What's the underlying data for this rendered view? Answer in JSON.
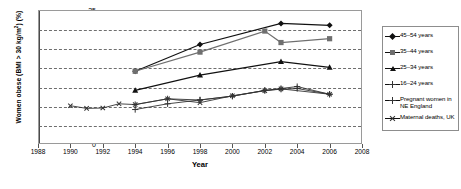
{
  "chart_data": {
    "type": "line",
    "title": "",
    "xlabel": "Year",
    "ylabel": "Women obese (BMI > 30 kg/m²) (%)",
    "ylabel_main": "Women obese (BMI > 30 kg/m",
    "ylabel_sup": "2",
    "ylabel_tail": ") (%)",
    "xlim": [
      1988,
      2008
    ],
    "ylim": [
      0,
      35
    ],
    "xticks": [
      1988,
      1990,
      1992,
      1994,
      1996,
      1998,
      2000,
      2002,
      2004,
      2006,
      2008
    ],
    "yticks": [
      0,
      5,
      10,
      15,
      20,
      25,
      30,
      35
    ],
    "grid": "horizontal-dashed",
    "legend_position": "right-outside",
    "series": [
      {
        "name": "45–54 years",
        "marker": "diamond",
        "color": "#111111",
        "points": [
          [
            1994,
            19.0
          ],
          [
            1998,
            26.0
          ],
          [
            2003,
            31.5
          ],
          [
            2006,
            31.0
          ]
        ]
      },
      {
        "name": "35–44 years",
        "marker": "square",
        "color": "#6f6f6f",
        "points": [
          [
            1994,
            19.0
          ],
          [
            1998,
            24.0
          ],
          [
            2002,
            29.5
          ],
          [
            2003,
            26.5
          ],
          [
            2006,
            27.5
          ]
        ]
      },
      {
        "name": "25–34 years",
        "marker": "triangle",
        "color": "#111111",
        "points": [
          [
            1994,
            14.0
          ],
          [
            1998,
            18.0
          ],
          [
            2003,
            21.5
          ],
          [
            2006,
            20.0
          ]
        ]
      },
      {
        "name": "16–24 years",
        "marker": "plus",
        "color": "#333333",
        "points": [
          [
            1994,
            9.0
          ],
          [
            1996,
            10.5
          ],
          [
            1998,
            11.5
          ],
          [
            2000,
            12.5
          ],
          [
            2002,
            14.0
          ],
          [
            2003,
            14.5
          ],
          [
            2004,
            15.0
          ],
          [
            2006,
            13.0
          ]
        ]
      },
      {
        "name": "Pregnant women in\nNE England",
        "marker": "plus",
        "color": "#333333",
        "points": [
          [
            1994,
            10.3
          ],
          [
            1996,
            11.8
          ],
          [
            1998,
            11.5
          ],
          [
            2000,
            12.5
          ],
          [
            2002,
            14.0
          ],
          [
            2003,
            14.3
          ],
          [
            2004,
            14.5
          ],
          [
            2006,
            13.0
          ]
        ]
      },
      {
        "name": "Maternal deaths, UK",
        "marker": "cross",
        "color": "#333333",
        "points": [
          [
            1990,
            10.0
          ],
          [
            1991,
            9.3
          ],
          [
            1992,
            9.4
          ],
          [
            1993,
            10.5
          ],
          [
            1994,
            10.3
          ],
          [
            1996,
            11.8
          ],
          [
            1998,
            10.8
          ],
          [
            2000,
            12.6
          ],
          [
            2002,
            13.9
          ],
          [
            2003,
            14.4
          ],
          [
            2006,
            13.0
          ]
        ]
      }
    ]
  },
  "legend": {
    "items": [
      {
        "label": "45–54 years",
        "marker": "diamond"
      },
      {
        "label": "35–44 years",
        "marker": "square"
      },
      {
        "label": "25–34 years",
        "marker": "triangle"
      },
      {
        "label": "16–24 years",
        "marker": "plus"
      },
      {
        "label": "Pregnant women in\nNE England",
        "marker": "plus"
      },
      {
        "label": "Maternal deaths, UK",
        "marker": "cross"
      }
    ]
  }
}
